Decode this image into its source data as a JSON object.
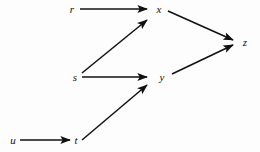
{
  "diagram": {
    "type": "directed-graph",
    "title": "",
    "background_color": "#fdfdfd",
    "edge_color": "#111111",
    "label_color": "#111111",
    "width": 260,
    "height": 152,
    "nodes": [
      {
        "id": "r",
        "label": "r",
        "x": 72,
        "y": 9
      },
      {
        "id": "x",
        "label": "x",
        "x": 159,
        "y": 9
      },
      {
        "id": "s",
        "label": "s",
        "x": 75,
        "y": 77
      },
      {
        "id": "y",
        "label": "y",
        "x": 162,
        "y": 77
      },
      {
        "id": "z",
        "label": "z",
        "x": 245,
        "y": 42
      },
      {
        "id": "u",
        "label": "u",
        "x": 13,
        "y": 140
      },
      {
        "id": "t",
        "label": "t",
        "x": 76,
        "y": 140
      }
    ],
    "edges": [
      {
        "id": "r-x",
        "from": "r",
        "to": "x",
        "x1": 80,
        "y1": 9,
        "x2": 147,
        "y2": 9
      },
      {
        "id": "s-x",
        "from": "s",
        "to": "x",
        "x1": 82,
        "y1": 73,
        "x2": 147,
        "y2": 20
      },
      {
        "id": "s-y",
        "from": "s",
        "to": "y",
        "x1": 82,
        "y1": 77,
        "x2": 147,
        "y2": 77
      },
      {
        "id": "t-y",
        "from": "t",
        "to": "y",
        "x1": 82,
        "y1": 140,
        "x2": 147,
        "y2": 85
      },
      {
        "id": "x-z",
        "from": "x",
        "to": "z",
        "x1": 168,
        "y1": 11,
        "x2": 233,
        "y2": 40
      },
      {
        "id": "y-z",
        "from": "y",
        "to": "z",
        "x1": 172,
        "y1": 74,
        "x2": 233,
        "y2": 45
      },
      {
        "id": "u-t",
        "from": "u",
        "to": "t",
        "x1": 20,
        "y1": 140,
        "x2": 70,
        "y2": 140
      }
    ]
  }
}
